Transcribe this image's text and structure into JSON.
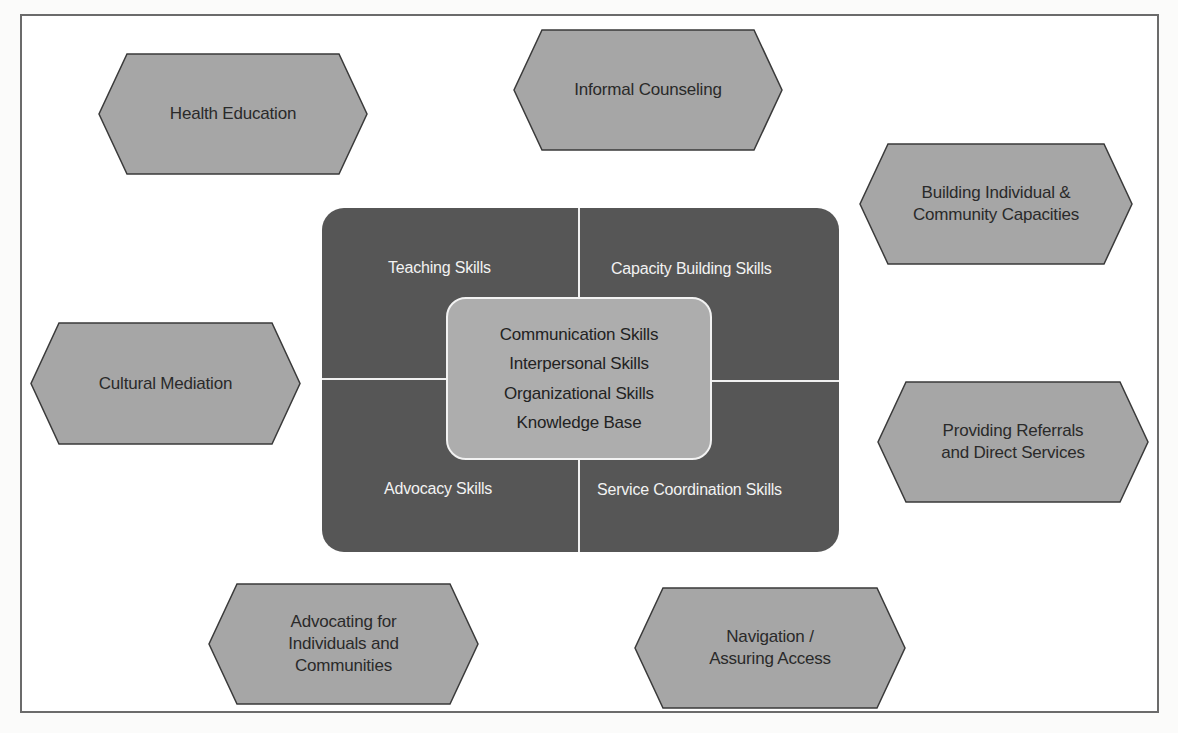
{
  "colors": {
    "frame_border": "#6b6b6b",
    "hexagon_fill": "#a6a6a6",
    "hexagon_stroke": "#3a3a3a",
    "core_panel": "#565656",
    "center_box": "#adadad",
    "divider": "#f0f0f0"
  },
  "roles": [
    {
      "id": "health-education",
      "label": "Health Education"
    },
    {
      "id": "informal-counseling",
      "label": "Informal Counseling"
    },
    {
      "id": "building-capacities",
      "label": "Building Individual &\nCommunity Capacities"
    },
    {
      "id": "cultural-mediation",
      "label": "Cultural Mediation"
    },
    {
      "id": "providing-referrals",
      "label": "Providing Referrals\nand Direct Services"
    },
    {
      "id": "advocating",
      "label": "Advocating for\nIndividuals and\nCommunities"
    },
    {
      "id": "navigation",
      "label": "Navigation /\nAssuring Access"
    }
  ],
  "core": {
    "quadrants": {
      "top_left": "Teaching Skills",
      "top_right": "Capacity Building Skills",
      "bottom_left": "Advocacy Skills",
      "bottom_right": "Service Coordination Skills"
    },
    "center": [
      "Communication Skills",
      "Interpersonal Skills",
      "Organizational Skills",
      "Knowledge Base"
    ]
  }
}
